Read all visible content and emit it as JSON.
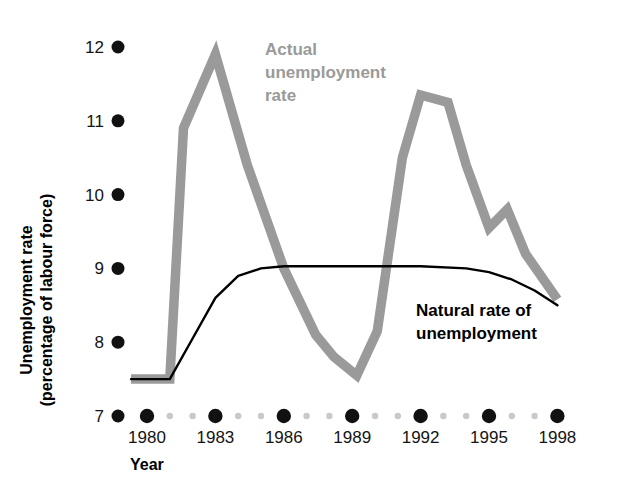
{
  "chart_data": {
    "type": "line",
    "title": "",
    "xlabel": "Year",
    "ylabel": "Unemployment rate (percentage of labour force)",
    "ylabel_line1": "Unemployment rate",
    "ylabel_line2": "(percentage of labour force)",
    "xlim": [
      1979.3,
      1998.6
    ],
    "ylim": [
      7,
      12
    ],
    "ytick_values": [
      7,
      8,
      9,
      10,
      11,
      12
    ],
    "ytick_labels": [
      "7",
      "8",
      "9",
      "10",
      "11",
      "12"
    ],
    "xtick_values": [
      1980,
      1983,
      1986,
      1989,
      1992,
      1995,
      1998
    ],
    "xtick_labels": [
      "1980",
      "1983",
      "1986",
      "1989",
      "1992",
      "1995",
      "1998"
    ],
    "xminor_values": [
      1981,
      1982,
      1984,
      1985,
      1987,
      1988,
      1990,
      1991,
      1993,
      1994,
      1996,
      1997
    ],
    "grid": false,
    "legend_position": "inline-annotation",
    "x": [
      1979.3,
      1981,
      1982,
      1983,
      1984,
      1985,
      1986,
      1987,
      1988,
      1989,
      1990,
      1991,
      1992,
      1993,
      1994,
      1995,
      1996,
      1997,
      1998
    ],
    "series": [
      {
        "name": "Actual unemployment rate",
        "color": "#9a9a9a",
        "style": "thick",
        "x": [
          1979.3,
          1981.0,
          1981.6,
          1983.0,
          1984.4,
          1986.0,
          1987.4,
          1988.2,
          1989.2,
          1990.1,
          1991.2,
          1992.0,
          1993.2,
          1994.0,
          1995.0,
          1995.8,
          1996.6,
          1998.0
        ],
        "values": [
          7.5,
          7.5,
          10.9,
          11.9,
          10.4,
          9.0,
          8.1,
          7.8,
          7.55,
          8.15,
          10.5,
          11.35,
          11.25,
          10.4,
          9.55,
          9.8,
          9.2,
          8.58
        ]
      },
      {
        "name": "Natural rate of unemployment",
        "color": "#000000",
        "style": "thin",
        "x": [
          1979.3,
          1981.0,
          1982.0,
          1983.0,
          1984.0,
          1985.0,
          1986.0,
          1988.0,
          1990.0,
          1992.0,
          1994.0,
          1995.0,
          1996.0,
          1997.0,
          1998.0
        ],
        "values": [
          7.5,
          7.5,
          8.05,
          8.6,
          8.9,
          9.0,
          9.03,
          9.03,
          9.03,
          9.03,
          9.0,
          8.95,
          8.85,
          8.7,
          8.5
        ]
      }
    ],
    "annotations": [
      {
        "id": "actual-label",
        "lines": [
          "Actual",
          "unemployment",
          "rate"
        ],
        "color": "#9a9a9a",
        "x_px": 265,
        "y_px": 55
      },
      {
        "id": "natural-label",
        "lines": [
          "Natural rate of",
          "unemployment"
        ],
        "color": "#000000",
        "x_px": 416,
        "y_px": 316
      }
    ]
  }
}
